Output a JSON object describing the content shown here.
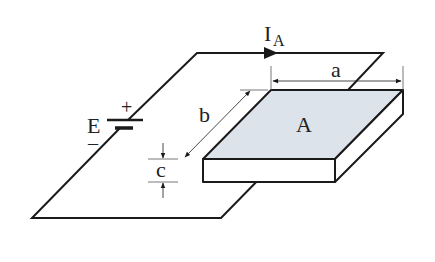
{
  "diagram": {
    "labels": {
      "current": "I",
      "current_sub": "A",
      "dim_a": "a",
      "dim_b": "b",
      "dim_c": "c",
      "area": "A",
      "source": "E",
      "plus": "+",
      "minus": "–"
    },
    "colors": {
      "line": "#1a1a1a",
      "fill_top": "#dde3ea",
      "fill_side": "#ffffff",
      "dim_line": "#555555"
    }
  }
}
